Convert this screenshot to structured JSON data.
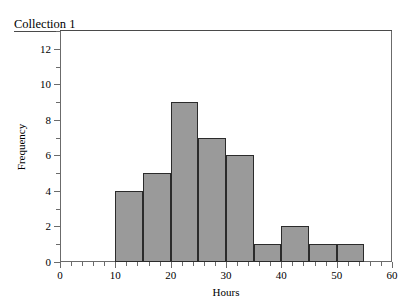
{
  "collection": {
    "title": "Collection 1"
  },
  "chart_data": {
    "type": "bar",
    "chart_kind": "histogram",
    "title": "",
    "xlabel": "Hours",
    "ylabel": "Frequency",
    "xlim": [
      0,
      60
    ],
    "ylim": [
      0,
      13
    ],
    "bin_width": 5,
    "grid": false,
    "legend": null,
    "bar_color": "#9a9a9a",
    "bar_edge_color": "#2b2b2b",
    "axis_color": "#6b6b6b",
    "x_major_ticks": [
      0,
      10,
      20,
      30,
      40,
      50,
      60
    ],
    "x_tick_labels": [
      "0",
      "10",
      "20",
      "30",
      "40",
      "50",
      "60"
    ],
    "x_minor_step": 2,
    "y_major_ticks": [
      0,
      2,
      4,
      6,
      8,
      10,
      12
    ],
    "y_tick_labels": [
      "0",
      "2",
      "4",
      "6",
      "8",
      "10",
      "12"
    ],
    "y_minor_ticks": [
      1,
      3,
      5,
      7,
      9,
      11,
      13
    ],
    "bins": [
      {
        "start": 10,
        "end": 15,
        "value": 4
      },
      {
        "start": 15,
        "end": 20,
        "value": 5
      },
      {
        "start": 20,
        "end": 25,
        "value": 9
      },
      {
        "start": 25,
        "end": 30,
        "value": 7
      },
      {
        "start": 30,
        "end": 35,
        "value": 6
      },
      {
        "start": 35,
        "end": 40,
        "value": 1
      },
      {
        "start": 40,
        "end": 45,
        "value": 2
      },
      {
        "start": 45,
        "end": 50,
        "value": 1
      },
      {
        "start": 50,
        "end": 55,
        "value": 1
      }
    ],
    "categories": [
      "10-15",
      "15-20",
      "20-25",
      "25-30",
      "30-35",
      "35-40",
      "40-45",
      "45-50",
      "50-55"
    ],
    "values": [
      4,
      5,
      9,
      7,
      6,
      1,
      2,
      1,
      1
    ]
  }
}
